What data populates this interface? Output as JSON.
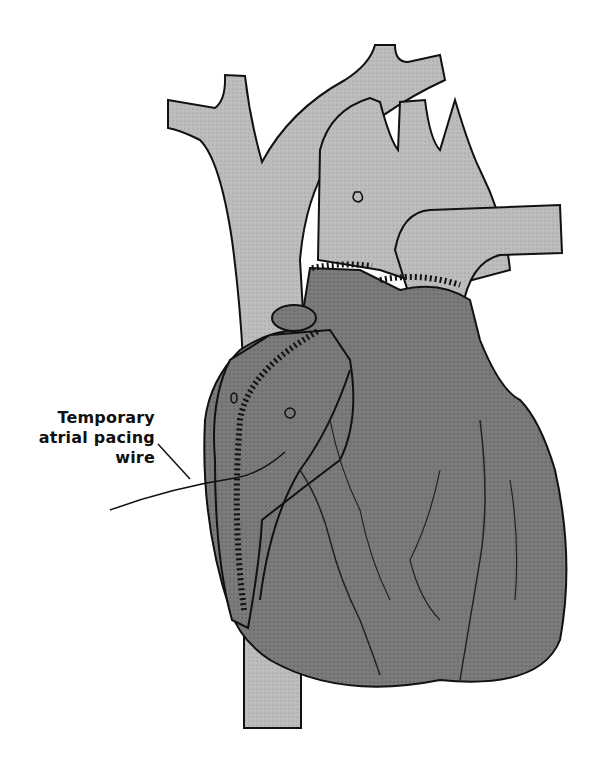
{
  "figure": {
    "colors": {
      "vessel_fill": "#bdbdbd",
      "heart_fill": "#7a7a7a",
      "heart_shadow": "#555555",
      "outline": "#111111",
      "background": "#ffffff"
    }
  },
  "labels": [
    {
      "lines": [
        "Temporary",
        "atrial pacing",
        "wire"
      ],
      "target": "right-atrium"
    }
  ]
}
